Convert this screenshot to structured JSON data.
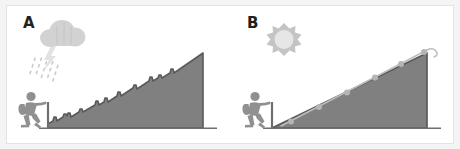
{
  "figure": {
    "title": "",
    "background_color": "#f4f4f4",
    "card_color": "#ffffff",
    "border_color": "#e3e3e3",
    "width": 460,
    "height": 149
  },
  "colors": {
    "mountain_fill": "#808080",
    "mountain_outline": "#575757",
    "cloud_fill": "#d0d0d0",
    "rain_fill": "#c9c9c9",
    "lightning_fill": "#e0e0e0",
    "sun_fill": "#c4c4c4",
    "sun_center": "#e4e4e4",
    "hiker_fill": "#909090",
    "path_line": "#bdbdbd",
    "path_dot": "#b5b5b5",
    "label_color": "#231f20",
    "trailhead_post": "#6f6f6f"
  },
  "panels": [
    {
      "id": "panel-a",
      "label": "A",
      "weather_icon": "rain-cloud-icon",
      "weather_name": "storm-cloud-with-rain-and-lightning",
      "terrain": "jagged-rocky-slope",
      "has_trail_path": false,
      "hiker": {
        "icon": "hiker-icon",
        "position": "at-base-of-slope",
        "facing": "uphill",
        "accessories": [
          "backpack",
          "walking-stick"
        ]
      },
      "mountain": {
        "shape": "right-triangle",
        "apex": "top-right",
        "surface": "rough-stepped-edge"
      }
    },
    {
      "id": "panel-b",
      "label": "B",
      "weather_icon": "sun-icon",
      "weather_name": "sun-with-rays",
      "terrain": "smooth-slope-with-marked-trail",
      "has_trail_path": true,
      "hiker": {
        "icon": "hiker-icon",
        "position": "at-base-of-slope",
        "facing": "uphill",
        "accessories": [
          "backpack",
          "walking-stick"
        ]
      },
      "mountain": {
        "shape": "right-triangle",
        "apex": "top-right",
        "surface": "smooth-edge"
      },
      "trail": {
        "name": "marked-trail-path",
        "marker_count": 6,
        "markers": [
          {
            "x": 60,
            "y": 116
          },
          {
            "x": 88,
            "y": 100
          },
          {
            "x": 116,
            "y": 85
          },
          {
            "x": 144,
            "y": 70
          },
          {
            "x": 170,
            "y": 56
          },
          {
            "x": 195,
            "y": 43
          }
        ],
        "end_decoration": "curved-hook-at-summit"
      }
    }
  ]
}
